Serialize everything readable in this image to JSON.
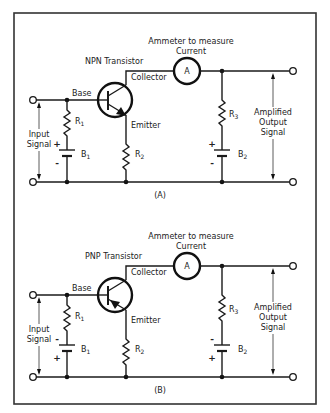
{
  "figure": {
    "colors": {
      "line": "#1a1a1a",
      "background": "#ffffff"
    },
    "circuits": [
      {
        "id": "A",
        "caption": "(A)",
        "transistor_label": "NPN Transistor",
        "transistor_type": "NPN",
        "ammeter_title_line1": "Ammeter to measure",
        "ammeter_title_line2": "Current",
        "ammeter_symbol": "A",
        "base_label": "Base",
        "collector_label": "Collector",
        "emitter_label": "Emitter",
        "r1": {
          "letter": "R",
          "sub": "1"
        },
        "r2": {
          "letter": "R",
          "sub": "2"
        },
        "r3": {
          "letter": "R",
          "sub": "3"
        },
        "b1": {
          "letter": "B",
          "sub": "1",
          "top_sign": "+",
          "bottom_sign": "-"
        },
        "b2": {
          "letter": "B",
          "sub": "2",
          "top_sign": "+",
          "bottom_sign": "-"
        },
        "input_label_line1": "Input",
        "input_label_line2": "Signal",
        "output_label_line1": "Amplified",
        "output_label_line2": "Output",
        "output_label_line3": "Signal"
      },
      {
        "id": "B",
        "caption": "(B)",
        "transistor_label": "PNP Transistor",
        "transistor_type": "PNP",
        "ammeter_title_line1": "Ammeter to measure",
        "ammeter_title_line2": "Current",
        "ammeter_symbol": "A",
        "base_label": "Base",
        "collector_label": "Collector",
        "emitter_label": "Emitter",
        "r1": {
          "letter": "R",
          "sub": "1"
        },
        "r2": {
          "letter": "R",
          "sub": "2"
        },
        "r3": {
          "letter": "R",
          "sub": "3"
        },
        "b1": {
          "letter": "B",
          "sub": "1",
          "top_sign": "-",
          "bottom_sign": "+"
        },
        "b2": {
          "letter": "B",
          "sub": "2",
          "top_sign": "-",
          "bottom_sign": "+"
        },
        "input_label_line1": "Input",
        "input_label_line2": "Signal",
        "output_label_line1": "Amplified",
        "output_label_line2": "Output",
        "output_label_line3": "Signal"
      }
    ]
  }
}
